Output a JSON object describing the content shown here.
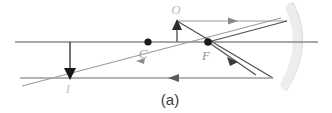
{
  "figure": {
    "caption": "(a)",
    "width": 332,
    "height": 113,
    "background_color": "#ffffff"
  },
  "labels": {
    "object": "O",
    "center_of_curvature": "C",
    "focal_point": "F",
    "image": "I"
  },
  "colors": {
    "principal_axis": "#8a8a8a",
    "ray_light": "#9a9a9a",
    "ray_dark": "#4a4a4a",
    "mirror": "#dcdcdc",
    "point_marker": "#1a1a1a",
    "object_arrow": "#2a2a2a",
    "image_arrow": "#1a1a1a",
    "label_light": "#b4b4b4",
    "label_mid": "#9a9a9a",
    "caption": "#3c3c3c"
  },
  "chart_data": {
    "type": "diagram",
    "title": "(a)",
    "axis": {
      "name": "principal-axis",
      "y": 42,
      "x_start": 15,
      "x_end": 318
    },
    "points": [
      {
        "name": "C",
        "label": "C",
        "x": 148,
        "y": 42,
        "label_x": 143,
        "label_y": 56
      },
      {
        "name": "F",
        "label": "F",
        "x": 208,
        "y": 42,
        "label_x": 206,
        "label_y": 58
      }
    ],
    "object": {
      "label": "O",
      "base_x": 177,
      "base_y": 42,
      "tip_x": 177,
      "tip_y": 21,
      "label_x": 176,
      "label_y": 12,
      "direction": "up"
    },
    "image": {
      "label": "I",
      "base_x": 70,
      "base_y": 42,
      "tip_x": 70,
      "tip_y": 79,
      "label_x": 68,
      "label_y": 92,
      "direction": "down",
      "orientation": "inverted"
    },
    "mirror": {
      "type": "concave",
      "top_x": 292,
      "top_y": 6,
      "vertex_x": 305,
      "vertex_y": 44,
      "bottom_x": 287,
      "bottom_y": 86
    },
    "rays": [
      {
        "name": "parallel-incident-ray",
        "from": [
          177,
          21
        ],
        "to": [
          287,
          21
        ],
        "arrow_at": [
          233,
          21
        ],
        "arrow_dir": "right"
      },
      {
        "name": "reflected-through-focus-ray",
        "from": [
          287,
          21
        ],
        "to": [
          255,
          74
        ],
        "arrow_at": [
          232,
          58
        ],
        "arrow_dir": "down-right",
        "via": [
          208,
          42
        ]
      },
      {
        "name": "ray-through-focus-incident",
        "from": [
          177,
          21
        ],
        "to": [
          272,
          78
        ],
        "arrow_at": null,
        "arrow_dir": null
      },
      {
        "name": "reflected-parallel-ray",
        "from": [
          272,
          78
        ],
        "to": [
          20,
          78
        ],
        "arrow_at": [
          172,
          78
        ],
        "arrow_dir": "left"
      },
      {
        "name": "long-diagonal-ray",
        "from": [
          280,
          18
        ],
        "to": [
          22,
          86
        ],
        "arrow_at": [
          136,
          61
        ],
        "arrow_dir": "left-down"
      }
    ]
  }
}
